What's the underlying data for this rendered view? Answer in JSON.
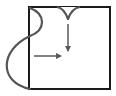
{
  "diagram": {
    "colors": {
      "background": "#ffffff",
      "square_stroke": "#1a1a1a",
      "curve_stroke": "#555555",
      "arrow_stroke": "#5a5a5a"
    },
    "shapes": {
      "square": {
        "x": 29,
        "y": 7,
        "width": 81,
        "height": 82
      },
      "left_curve": "M30,8 C46,14 46,30 30,36 C0,50 -2,82 30,89",
      "top_notch": "M57,7 Q64,8 68,19 Q72,8 80,7",
      "arrow_down": {
        "x1": 68,
        "y1": 24,
        "x2": 68,
        "y2": 52
      },
      "arrow_right": {
        "x1": 34,
        "y1": 56,
        "x2": 62,
        "y2": 56
      }
    }
  }
}
